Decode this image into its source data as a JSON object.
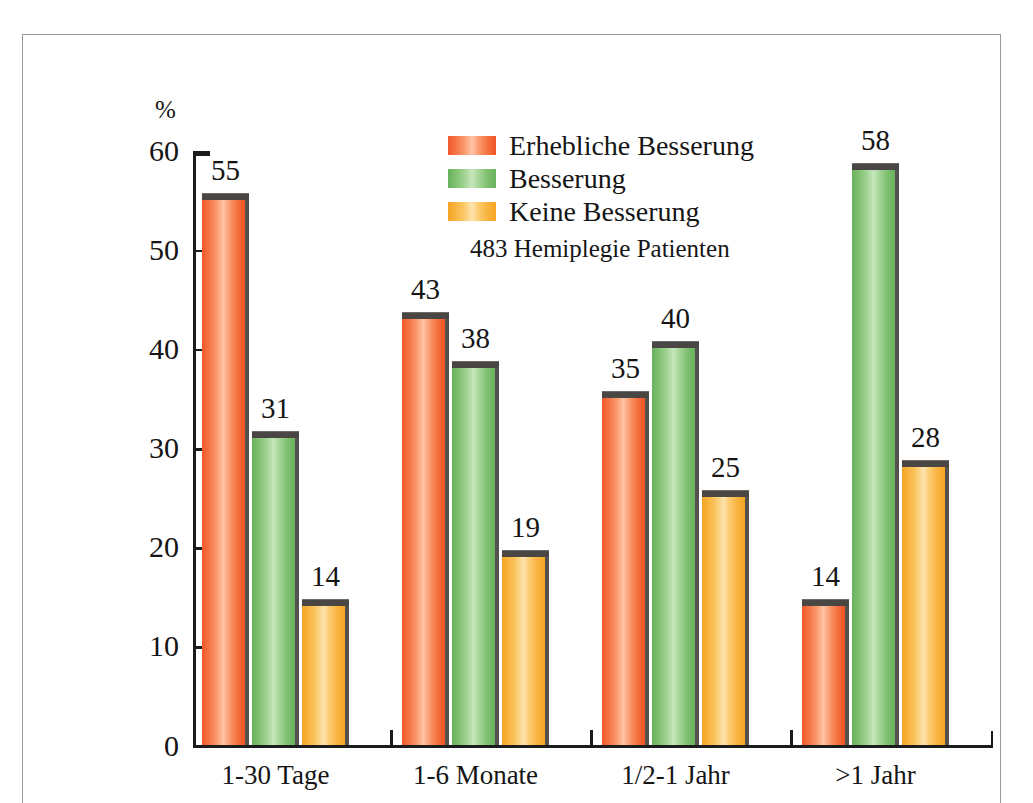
{
  "chart_data": {
    "type": "bar",
    "title": "",
    "subtitle": "483 Hemiplegie Patienten",
    "xlabel": "",
    "ylabel": "%",
    "ylim": [
      0,
      60
    ],
    "yticks": [
      0,
      10,
      20,
      30,
      40,
      50,
      60
    ],
    "ytick_labels": [
      "0",
      "10",
      "20",
      "30",
      "40",
      "50",
      "60"
    ],
    "grid": false,
    "legend_position": "upper-center",
    "categories": [
      "1-30 Tage",
      "1-6 Monate",
      "1/2-1 Jahr",
      ">1 Jahr"
    ],
    "series": [
      {
        "name": "Erhebliche Besserung",
        "color": "#f4673a",
        "values": [
          55,
          43,
          35,
          14
        ],
        "value_labels": [
          "55",
          "43",
          "35",
          "14"
        ]
      },
      {
        "name": "Besserung",
        "color": "#77bb68",
        "values": [
          31,
          38,
          40,
          58
        ],
        "value_labels": [
          "31",
          "38",
          "40",
          "58"
        ]
      },
      {
        "name": "Keine Besserung",
        "color": "#f7ae36",
        "values": [
          14,
          19,
          25,
          28
        ],
        "value_labels": [
          "14",
          "19",
          "25",
          "28"
        ]
      }
    ]
  },
  "axis": {
    "y_unit": "%"
  },
  "colors": {
    "orange": "#f4673a",
    "green": "#77bb68",
    "yellow": "#f7ae36",
    "axis": "#1b1b1b",
    "frame": "#9a9a9a",
    "bar_shadow": "#55514e",
    "text": "#151515"
  }
}
